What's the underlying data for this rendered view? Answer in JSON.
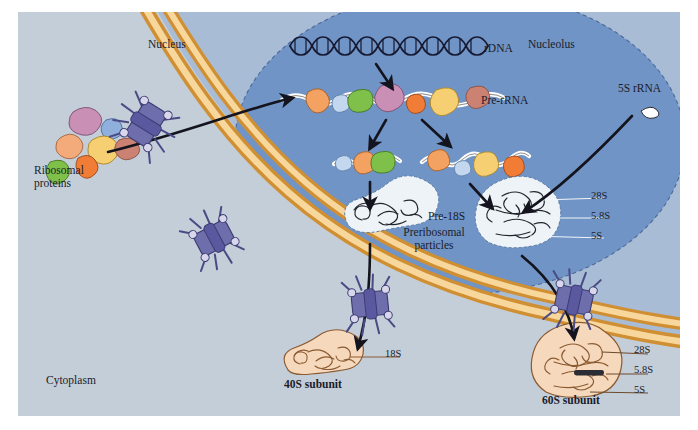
{
  "figure": {
    "regions": {
      "cytoplasm": "Cytoplasm",
      "nucleus": "Nucleus",
      "nucleolus": "Nucleolus"
    },
    "colors": {
      "cytoplasm_bg": "#c4ced8",
      "nucleus_bg": "#9db4d2",
      "nucleolus_bg": "#6f93c4",
      "envelope_outer": "#d89a3e",
      "envelope_inner": "#f3c983",
      "pore_body": "#6b6aa8",
      "pore_shadow": "#4a4a85",
      "rna_white": "#ffffff",
      "rna_outline": "#2a2a2a",
      "subunit_fill": "#f6d9bd",
      "subunit_outline": "#7a5230",
      "arrow": "#14141e",
      "label_text": "#1a1c2a",
      "nucleolus_particle": "#eef2f7"
    },
    "labels": [
      {
        "id": "cytoplasm",
        "text": "Cytoplasm",
        "x": 46,
        "y": 374,
        "style": "md"
      },
      {
        "id": "nucleus",
        "text": "Nucleus",
        "x": 148,
        "y": 38,
        "style": "md"
      },
      {
        "id": "nucleolus",
        "text": "Nucleolus",
        "x": 528,
        "y": 38,
        "style": "md"
      },
      {
        "id": "rdna",
        "text": "rDNA",
        "x": 482,
        "y": 42,
        "style": "md"
      },
      {
        "id": "pre-rrna",
        "text": "Pre-rRNA",
        "x": 479,
        "y": 94,
        "style": "md"
      },
      {
        "id": "5s-rrna",
        "text": "5S rRNA",
        "x": 617,
        "y": 83,
        "style": "md"
      },
      {
        "id": "pre-18s",
        "text": "Pre-18S",
        "x": 427,
        "y": 211,
        "style": "md"
      },
      {
        "id": "nucleolar-28s",
        "text": "28S",
        "x": 590,
        "y": 189,
        "style": "sm"
      },
      {
        "id": "nucleolar-5.8s",
        "text": "5.8S",
        "x": 590,
        "y": 209,
        "style": "sm"
      },
      {
        "id": "nucleolar-5s",
        "text": "5S",
        "x": 590,
        "y": 229,
        "style": "sm"
      },
      {
        "id": "ribosomal-proteins",
        "text": "Ribosomal\nproteins",
        "x": 34,
        "y": 168,
        "style": "md"
      },
      {
        "id": "preribosomal-particles",
        "text": "Preribosomal\nparticles",
        "x": 390,
        "y": 227,
        "style": "md"
      },
      {
        "id": "18s",
        "text": "18S",
        "x": 386,
        "y": 352,
        "style": "sm"
      },
      {
        "id": "40s-subunit",
        "text": "40S subunit",
        "x": 288,
        "y": 383,
        "style": "bold"
      },
      {
        "id": "cyto-28s",
        "text": "28S",
        "x": 634,
        "y": 345,
        "style": "sm"
      },
      {
        "id": "cyto-5.8s",
        "text": "5.8S",
        "x": 634,
        "y": 365,
        "style": "sm"
      },
      {
        "id": "cyto-5s",
        "text": "5S",
        "x": 634,
        "y": 384,
        "style": "sm"
      },
      {
        "id": "60s-subunit",
        "text": "60S subunit",
        "x": 545,
        "y": 396,
        "style": "bold"
      }
    ],
    "ribosomal_protein_blobs": [
      {
        "fill": "#c98fb5",
        "x": 62,
        "y": 104,
        "w": 22,
        "h": 19,
        "rot": -12
      },
      {
        "fill": "#8fb0dd",
        "x": 90,
        "y": 112,
        "w": 15,
        "h": 15,
        "rot": 8
      },
      {
        "fill": "#f3a97a",
        "x": 47,
        "y": 128,
        "w": 19,
        "h": 17,
        "rot": 15
      },
      {
        "fill": "#f6cf72",
        "x": 77,
        "y": 130,
        "w": 22,
        "h": 19,
        "rot": -5
      },
      {
        "fill": "#cc8272",
        "x": 103,
        "y": 130,
        "w": 20,
        "h": 16,
        "rot": 20
      },
      {
        "fill": "#f07c36",
        "x": 62,
        "y": 148,
        "w": 18,
        "h": 16,
        "rot": 30
      },
      {
        "fill": "#7fc04a",
        "x": 36,
        "y": 152,
        "w": 18,
        "h": 18,
        "rot": -20
      }
    ],
    "nuclear_pores": [
      {
        "id": "pore-import",
        "x": 128,
        "y": 112,
        "rot": -58
      },
      {
        "id": "pore-left",
        "x": 194,
        "y": 222,
        "rot": -28
      },
      {
        "id": "pore-40s",
        "x": 356,
        "y": 290,
        "rot": -4
      },
      {
        "id": "pore-60s",
        "x": 558,
        "y": 288,
        "rot": 10
      }
    ],
    "processing_steps": [
      {
        "id": "rdna-transcript",
        "label": "rDNA"
      },
      {
        "id": "pre-rrna-primary",
        "label": "Pre-rRNA"
      },
      {
        "id": "pre-rrna-small",
        "label": "small-subunit precursor"
      },
      {
        "id": "pre-rrna-large",
        "label": "large-subunit precursor"
      },
      {
        "id": "pre-18s-particle",
        "label": "Pre-18S"
      },
      {
        "id": "pre-60s-particle",
        "label": "Preribosomal particle"
      }
    ]
  }
}
